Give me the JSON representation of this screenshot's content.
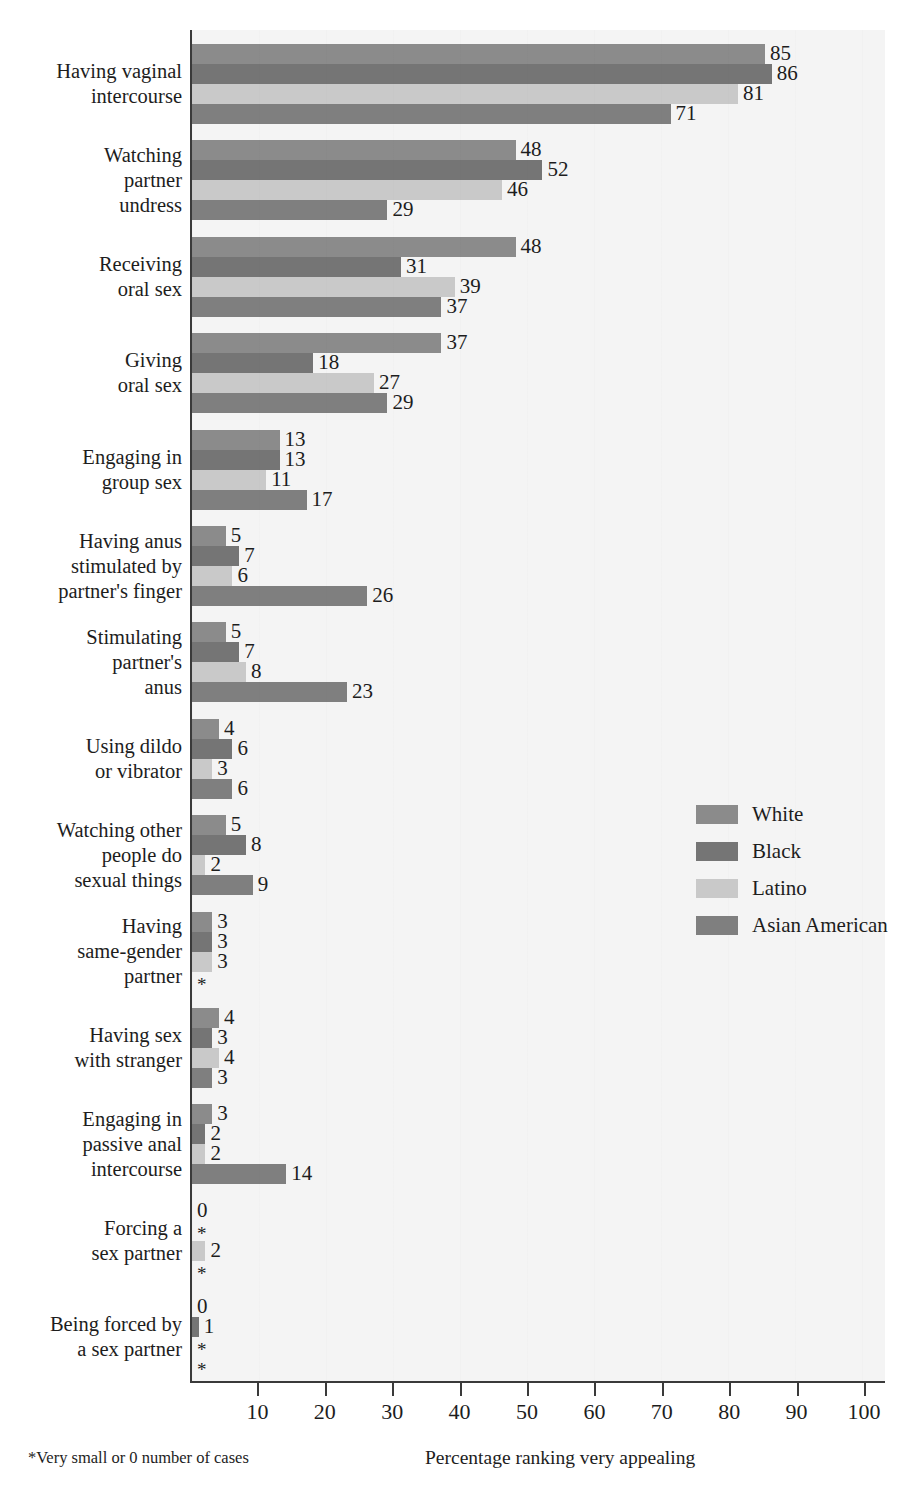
{
  "chart_data": {
    "type": "bar",
    "orientation": "horizontal",
    "grouped": true,
    "title": "",
    "subtitle": "",
    "xlabel": "Percentage ranking very appealing",
    "ylabel": "",
    "xlim": [
      0,
      100
    ],
    "xticks": [
      0,
      10,
      20,
      30,
      40,
      50,
      60,
      70,
      80,
      90,
      100
    ],
    "xtick_labels": [
      "",
      "10",
      "20",
      "30",
      "40",
      "50",
      "60",
      "70",
      "80",
      "90",
      "100"
    ],
    "grid": false,
    "legend_position": "center-right",
    "footnote": "*Very small or 0 number of cases",
    "categories": [
      "Having vaginal\nintercourse",
      "Watching\npartner\nundress",
      "Receiving\noral sex",
      "Giving\noral sex",
      "Engaging in\ngroup sex",
      "Having anus\nstimulated by\npartner's finger",
      "Stimulating\npartner's\nanus",
      "Using dildo\nor vibrator",
      "Watching other\npeople do\nsexual things",
      "Having\nsame-gender\npartner",
      "Having sex\nwith stranger",
      "Engaging in\npassive anal\nintercourse",
      "Forcing a\nsex partner",
      "Being forced by\na sex partner"
    ],
    "series": [
      {
        "name": "White",
        "color": "#8b8b8b",
        "values": [
          85,
          48,
          48,
          37,
          13,
          5,
          5,
          4,
          5,
          3,
          4,
          3,
          0,
          0
        ],
        "labels": [
          "85",
          "48",
          "48",
          "37",
          "13",
          "5",
          "5",
          "4",
          "5",
          "3",
          "4",
          "3",
          "0",
          "0"
        ]
      },
      {
        "name": "Black",
        "color": "#757575",
        "values": [
          86,
          52,
          31,
          18,
          13,
          7,
          7,
          6,
          8,
          3,
          3,
          2,
          0,
          1
        ],
        "labels": [
          "86",
          "52",
          "31",
          "18",
          "13",
          "7",
          "7",
          "6",
          "8",
          "3",
          "3",
          "2",
          "*",
          "1"
        ]
      },
      {
        "name": "Latino",
        "color": "#c9c9c9",
        "values": [
          81,
          46,
          39,
          27,
          11,
          6,
          8,
          3,
          2,
          3,
          4,
          2,
          2,
          0
        ],
        "labels": [
          "81",
          "46",
          "39",
          "27",
          "11",
          "6",
          "8",
          "3",
          "2",
          "3",
          "4",
          "2",
          "2",
          "*"
        ]
      },
      {
        "name": "Asian American",
        "color": "#7f7f7f",
        "values": [
          71,
          29,
          37,
          29,
          17,
          26,
          23,
          6,
          9,
          0,
          3,
          14,
          0,
          0
        ],
        "labels": [
          "71",
          "29",
          "37",
          "29",
          "17",
          "26",
          "23",
          "6",
          "9",
          "*",
          "3",
          "14",
          "*",
          "*"
        ]
      }
    ]
  },
  "legend": {
    "items": [
      {
        "label": "White"
      },
      {
        "label": "Black"
      },
      {
        "label": "Latino"
      },
      {
        "label": "Asian American"
      }
    ]
  },
  "axis": {
    "footnote": "*Very small or 0 number of cases",
    "xlabel": "Percentage ranking very appealing"
  }
}
